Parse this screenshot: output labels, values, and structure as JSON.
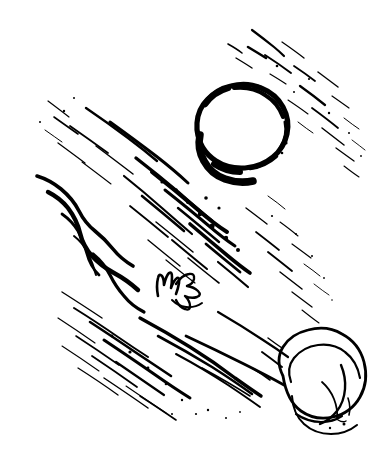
{
  "artwork": {
    "title": "Ink brush drawing",
    "medium": "black ink on white paper",
    "canvas": {
      "width": 390,
      "height": 459
    },
    "background_color": "#ffffff",
    "ink_color": "#000000",
    "subjects": [
      {
        "name": "circle-moon",
        "description": "rough hand-drawn open circle, upper right of center",
        "center": [
          240,
          130
        ],
        "radius": 45,
        "stroke_style": "broken dry-brush ring, heaviest at lower-left arc"
      },
      {
        "name": "ear-shell",
        "description": "ear / shell shaped oval with inner spiral contours, lower right",
        "center": [
          310,
          388
        ],
        "width": 78,
        "height": 92,
        "rotation_deg": -25
      },
      {
        "name": "hand-figure",
        "description": "small scribbled hand / figure motif at center of the streaks",
        "center": [
          180,
          288
        ],
        "width": 54,
        "height": 36
      },
      {
        "name": "diagonal-streaks",
        "description": "field of wind / rain brush streaks running from upper right to lower left",
        "direction_deg": 215,
        "coverage": "upper-left through lower-center",
        "stroke_count_approx": 40
      }
    ]
  }
}
